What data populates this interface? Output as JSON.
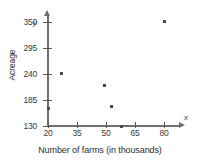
{
  "chart_data": {
    "type": "scatter",
    "title": "",
    "xlabel": "Number of farms (in thousands)",
    "ylabel": "Acreage",
    "x_axis_symbol": "x",
    "y_axis_symbol": "y",
    "xticks": [
      20,
      35,
      50,
      65,
      80
    ],
    "yticks": [
      130,
      185,
      240,
      295,
      350
    ],
    "xlim": [
      20,
      84
    ],
    "ylim": [
      130,
      362
    ],
    "grid": false,
    "legend": null,
    "points": [
      {
        "x": 20,
        "y": 168
      },
      {
        "x": 27,
        "y": 242
      },
      {
        "x": 49,
        "y": 215
      },
      {
        "x": 53,
        "y": 172
      },
      {
        "x": 58,
        "y": 130
      },
      {
        "x": 80,
        "y": 352
      }
    ],
    "marker": "square",
    "marker_color": "#4a4a4a",
    "axis_color": "#6e6e6e"
  }
}
